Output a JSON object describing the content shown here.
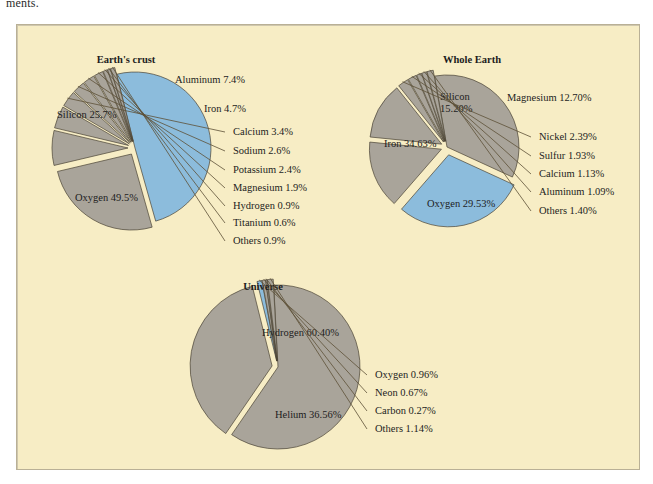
{
  "page": {
    "cut_text_above_figure": "ments.",
    "panel_bg": "#f7edc5",
    "panel_border": "#b9b096"
  },
  "palette": {
    "gray": "#a9a49a",
    "blue": "#8cbcdc",
    "outline": "#4a4335",
    "leader": "#5d5037",
    "text": "#1d1d1d"
  },
  "chart_data": [
    {
      "type": "pie",
      "title": "Earth's crust",
      "center": [
        118,
        123
      ],
      "radius": 76,
      "start_angle": -104,
      "labels_inside": [
        "Oxygen 49.5%",
        "Silicon 25.7%"
      ],
      "categories": [
        "Oxygen",
        "Silicon",
        "Aluminum",
        "Iron",
        "Calcium",
        "Sodium",
        "Potassium",
        "Magnesium",
        "Hydrogen",
        "Titanium",
        "Others"
      ],
      "values": [
        49.5,
        25.7,
        7.4,
        4.7,
        3.4,
        2.6,
        2.4,
        1.9,
        0.9,
        0.6,
        0.9
      ],
      "slices": [
        {
          "name": "Oxygen",
          "label": "Oxygen 49.5%",
          "value": 49.5,
          "color": "blue",
          "explode": 0,
          "placement": "inside",
          "label_xy": [
            58,
            176
          ]
        },
        {
          "name": "Silicon",
          "label": "Silicon 25.7%",
          "value": 25.7,
          "color": "gray",
          "explode": 7,
          "placement": "inside",
          "label_xy": [
            40,
            93
          ]
        },
        {
          "name": "Aluminum",
          "label": "Aluminum 7.4%",
          "value": 7.4,
          "color": "gray",
          "explode": 7,
          "placement": "outside",
          "label_xy": [
            158,
            58
          ],
          "leader": false
        },
        {
          "name": "Iron",
          "label": "Iron 4.7%",
          "value": 4.7,
          "color": "gray",
          "explode": 7,
          "placement": "outside",
          "label_xy": [
            187,
            87
          ],
          "leader": false
        },
        {
          "name": "Calcium",
          "label": "Calcium 3.4%",
          "value": 3.4,
          "color": "gray",
          "explode": 7,
          "placement": "outside",
          "label_xy": [
            216,
            110
          ],
          "leader": true
        },
        {
          "name": "Sodium",
          "label": "Sodium 2.6%",
          "value": 2.6,
          "color": "gray",
          "explode": 7,
          "placement": "outside",
          "label_xy": [
            216,
            129
          ],
          "leader": true
        },
        {
          "name": "Potassium",
          "label": "Potassium 2.4%",
          "value": 2.4,
          "color": "gray",
          "explode": 7,
          "placement": "outside",
          "label_xy": [
            216,
            148
          ],
          "leader": true
        },
        {
          "name": "Magnesium",
          "label": "Magnesium 1.9%",
          "value": 1.9,
          "color": "gray",
          "explode": 7,
          "placement": "outside",
          "label_xy": [
            216,
            166
          ],
          "leader": true
        },
        {
          "name": "Hydrogen",
          "label": "Hydrogen 0.9%",
          "value": 0.9,
          "color": "gray",
          "explode": 7,
          "placement": "outside",
          "label_xy": [
            216,
            184
          ],
          "leader": true
        },
        {
          "name": "Titanium",
          "label": "Titanium 0.6%",
          "value": 0.6,
          "color": "gray",
          "explode": 7,
          "placement": "outside",
          "label_xy": [
            216,
            201
          ],
          "leader": true
        },
        {
          "name": "Others",
          "label": "Others 0.9%",
          "value": 0.9,
          "color": "gray",
          "explode": 7,
          "placement": "outside",
          "label_xy": [
            216,
            219
          ],
          "leader": true
        }
      ]
    },
    {
      "type": "pie",
      "title": "Whole Earth",
      "center": [
        430,
        122
      ],
      "radius": 72,
      "start_angle": -100,
      "categories": [
        "Iron",
        "Oxygen",
        "Silicon",
        "Magnesium",
        "Nickel",
        "Sulfur",
        "Calcium",
        "Aluminum",
        "Others"
      ],
      "values": [
        34.63,
        29.53,
        15.2,
        12.7,
        2.39,
        1.93,
        1.13,
        1.09,
        1.4
      ],
      "slices": [
        {
          "name": "Iron",
          "label": "Iron 34.63%",
          "value": 34.63,
          "color": "gray",
          "explode": 0,
          "placement": "inside",
          "label_xy": [
            367,
            122
          ]
        },
        {
          "name": "Oxygen",
          "label": "Oxygen 29.53%",
          "value": 29.53,
          "color": "blue",
          "explode": 8,
          "placement": "inside",
          "label_xy": [
            410,
            182
          ]
        },
        {
          "name": "Silicon",
          "label": "Silicon\n15.20%",
          "value": 15.2,
          "color": "gray",
          "explode": 6,
          "placement": "inside",
          "label_xy": [
            423,
            75
          ]
        },
        {
          "name": "Magnesium",
          "label": "Magnesium 12.70%",
          "value": 12.7,
          "color": "gray",
          "explode": 6,
          "placement": "outside",
          "label_xy": [
            490,
            76
          ],
          "leader": false
        },
        {
          "name": "Nickel",
          "label": "Nickel 2.39%",
          "value": 2.39,
          "color": "gray",
          "explode": 6,
          "placement": "outside",
          "label_xy": [
            522,
            115
          ],
          "leader": true
        },
        {
          "name": "Sulfur",
          "label": "Sulfur 1.93%",
          "value": 1.93,
          "color": "gray",
          "explode": 6,
          "placement": "outside",
          "label_xy": [
            522,
            134
          ],
          "leader": true
        },
        {
          "name": "Calcium",
          "label": "Calcium 1.13%",
          "value": 1.13,
          "color": "gray",
          "explode": 6,
          "placement": "outside",
          "label_xy": [
            522,
            152
          ],
          "leader": true
        },
        {
          "name": "Aluminum",
          "label": "Aluminum 1.09%",
          "value": 1.09,
          "color": "gray",
          "explode": 6,
          "placement": "outside",
          "label_xy": [
            522,
            170
          ],
          "leader": true
        },
        {
          "name": "Others",
          "label": "Others 1.40%",
          "value": 1.4,
          "color": "gray",
          "explode": 6,
          "placement": "outside",
          "label_xy": [
            522,
            189
          ],
          "leader": true
        }
      ]
    },
    {
      "type": "pie",
      "title": "Universe",
      "center": [
        261,
        342
      ],
      "radius": 82,
      "start_angle": -93,
      "categories": [
        "Hydrogen",
        "Helium",
        "Oxygen",
        "Neon",
        "Carbon",
        "Others"
      ],
      "values": [
        60.4,
        36.56,
        0.96,
        0.67,
        0.27,
        1.14
      ],
      "slices": [
        {
          "name": "Hydrogen",
          "label": "Hydrogen 60.40%",
          "value": 60.4,
          "color": "gray",
          "explode": 0,
          "placement": "inside",
          "label_xy": [
            245,
            311
          ]
        },
        {
          "name": "Helium",
          "label": "Helium 36.56%",
          "value": 36.56,
          "color": "gray",
          "explode": 6,
          "placement": "inside",
          "label_xy": [
            258,
            393
          ]
        },
        {
          "name": "Oxygen",
          "label": "Oxygen 0.96%",
          "value": 0.96,
          "color": "blue",
          "explode": 6,
          "placement": "outside",
          "label_xy": [
            358,
            353
          ],
          "leader": true
        },
        {
          "name": "Neon",
          "label": "Neon 0.67%",
          "value": 0.67,
          "color": "gray",
          "explode": 6,
          "placement": "outside",
          "label_xy": [
            358,
            371
          ],
          "leader": true
        },
        {
          "name": "Carbon",
          "label": "Carbon 0.27%",
          "value": 0.27,
          "color": "gray",
          "explode": 6,
          "placement": "outside",
          "label_xy": [
            358,
            389
          ],
          "leader": true
        },
        {
          "name": "Others",
          "label": "Others 1.14%",
          "value": 1.14,
          "color": "gray",
          "explode": 6,
          "placement": "outside",
          "label_xy": [
            358,
            407
          ],
          "leader": true
        }
      ]
    }
  ],
  "titles": {
    "earths_crust": {
      "text": "Earth's crust",
      "xy": [
        109,
        38
      ]
    },
    "whole_earth": {
      "text": "Whole Earth",
      "xy": [
        455,
        38
      ]
    },
    "universe": {
      "text": "Universe",
      "xy": [
        246,
        265
      ]
    }
  }
}
